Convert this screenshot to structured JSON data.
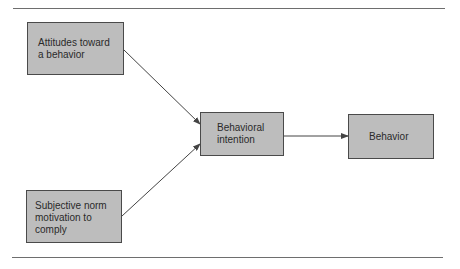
{
  "diagram": {
    "nodes": [
      {
        "id": "attitudes",
        "label": "Attitudes toward\na behavior"
      },
      {
        "id": "subjective_norm",
        "label": "Subjective norm\nmotivation to\ncomply"
      },
      {
        "id": "intention",
        "label": "Behavioral\nintention"
      },
      {
        "id": "behavior",
        "label": "Behavior"
      }
    ],
    "edges": [
      {
        "from": "attitudes",
        "to": "intention"
      },
      {
        "from": "subjective_norm",
        "to": "intention"
      },
      {
        "from": "intention",
        "to": "behavior"
      }
    ],
    "colors": {
      "box_fill": "#bdbdbd",
      "box_border": "#4a4a4a",
      "arrow": "#444444",
      "rule": "#6e6e6e"
    }
  }
}
